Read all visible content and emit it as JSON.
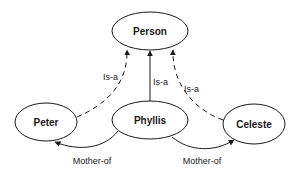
{
  "diagram": {
    "type": "semantic-network",
    "nodes": [
      {
        "id": "person",
        "label": "Person"
      },
      {
        "id": "peter",
        "label": "Peter"
      },
      {
        "id": "phyllis",
        "label": "Phyllis"
      },
      {
        "id": "celeste",
        "label": "Celeste"
      }
    ],
    "edges": [
      {
        "from": "peter",
        "to": "person",
        "label": "Is-a",
        "style": "dashed"
      },
      {
        "from": "phyllis",
        "to": "person",
        "label": "Is-a",
        "style": "solid"
      },
      {
        "from": "celeste",
        "to": "person",
        "label": "Is-a",
        "style": "dashed"
      },
      {
        "from": "phyllis",
        "to": "peter",
        "label": "Mother-of",
        "style": "solid"
      },
      {
        "from": "phyllis",
        "to": "celeste",
        "label": "Mother-of",
        "style": "solid"
      }
    ],
    "colors": {
      "stroke": "#1a1a1a",
      "background": "#ffffff"
    }
  }
}
